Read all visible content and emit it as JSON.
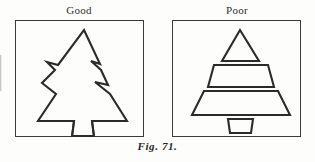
{
  "figure": {
    "caption": "Fig. 71.",
    "background_color": "#fdfdfc",
    "ink_color": "#2b2b29",
    "frame_color": "#3a3a38"
  },
  "panels": [
    {
      "id": "good",
      "label": "Good",
      "subject": "christmas-tree-silhouette",
      "description": "Single continuous outlined fir tree with notched stepped tiers and a trapezoid trunk",
      "shape_count": 1,
      "shapes": [
        "continuous-tree-outline"
      ]
    },
    {
      "id": "poor",
      "label": "Poor",
      "subject": "christmas-tree-stacked-shapes",
      "description": "Tree built from four separate disconnected geometric shapes stacked vertically",
      "shape_count": 4,
      "shapes": [
        "triangle-top-tier",
        "trapezoid-middle-tier",
        "trapezoid-bottom-tier",
        "trapezoid-trunk"
      ]
    }
  ]
}
